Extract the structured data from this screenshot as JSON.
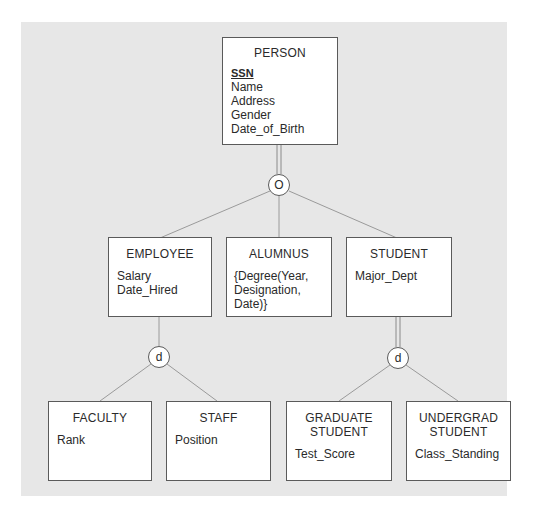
{
  "diagram": {
    "type": "EER specialization hierarchy",
    "entities": {
      "person": {
        "name": "PERSON",
        "key": "SSN",
        "attributes": [
          "Name",
          "Address",
          "Gender",
          "Date_of_Birth"
        ]
      },
      "employee": {
        "name": "EMPLOYEE",
        "attributes": [
          "Salary",
          "Date_Hired"
        ]
      },
      "alumnus": {
        "name": "ALUMNUS",
        "attributes": [
          "{Degree(Year,",
          "Designation,",
          "Date)}"
        ]
      },
      "student": {
        "name": "STUDENT",
        "attributes": [
          "Major_Dept"
        ]
      },
      "faculty": {
        "name": "FACULTY",
        "attributes": [
          "Rank"
        ]
      },
      "staff": {
        "name": "STAFF",
        "attributes": [
          "Position"
        ]
      },
      "graduate_student": {
        "name_line1": "GRADUATE",
        "name_line2": "STUDENT",
        "attributes": [
          "Test_Score"
        ]
      },
      "undergrad_student": {
        "name_line1": "UNDERGRAD",
        "name_line2": "STUDENT",
        "attributes": [
          "Class_Standing"
        ]
      }
    },
    "specializations": {
      "person": {
        "symbol": "O",
        "meaning": "overlapping",
        "participation": "total",
        "subclasses": [
          "EMPLOYEE",
          "ALUMNUS",
          "STUDENT"
        ]
      },
      "employee": {
        "symbol": "d",
        "meaning": "disjoint",
        "participation": "partial",
        "subclasses": [
          "FACULTY",
          "STAFF"
        ]
      },
      "student": {
        "symbol": "d",
        "meaning": "disjoint",
        "participation": "total",
        "subclasses": [
          "GRADUATE STUDENT",
          "UNDERGRAD STUDENT"
        ]
      }
    },
    "colors": {
      "background_panel": "#e7e7e7",
      "box_fill": "#ffffff",
      "line": "#8a8a8a",
      "border": "#5a5a5a"
    }
  }
}
